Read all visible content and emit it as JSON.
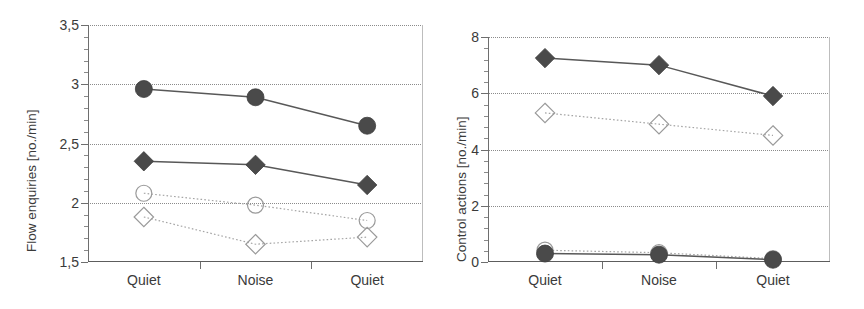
{
  "figure": {
    "panels": [
      "flow-enquiries",
      "control-actions"
    ]
  },
  "chart_data": [
    {
      "type": "line",
      "id": "flow-enquiries",
      "title": "",
      "xlabel": "",
      "ylabel": "Flow enquiries [no./min]",
      "categories": [
        "Quiet",
        "Noise",
        "Quiet"
      ],
      "ylim": [
        1.5,
        3.5
      ],
      "yticks": [
        1.5,
        2,
        2.5,
        3,
        3.5
      ],
      "ytick_labels": [
        "1,5",
        "2",
        "2,5",
        "3",
        "3,5"
      ],
      "minor_ticks_per_interval": 5,
      "grid": true,
      "grid_axis": "y",
      "grid_style": "dotted",
      "legend": "none",
      "series": [
        {
          "name": "filled-circle",
          "marker": "circle",
          "fill": "solid",
          "color": "#4a4a4a",
          "line_style": "solid",
          "values": [
            2.96,
            2.89,
            2.65
          ]
        },
        {
          "name": "filled-diamond",
          "marker": "diamond",
          "fill": "solid",
          "color": "#4a4a4a",
          "line_style": "solid",
          "values": [
            2.35,
            2.32,
            2.15
          ]
        },
        {
          "name": "open-circle",
          "marker": "circle",
          "fill": "open",
          "color": "#9a9a9a",
          "line_style": "dotted",
          "values": [
            2.08,
            1.98,
            1.85
          ]
        },
        {
          "name": "open-diamond",
          "marker": "diamond",
          "fill": "open",
          "color": "#9a9a9a",
          "line_style": "dotted",
          "values": [
            1.88,
            1.65,
            1.71
          ]
        }
      ]
    },
    {
      "type": "line",
      "id": "control-actions",
      "title": "",
      "xlabel": "",
      "ylabel": "Control actions [no./min]",
      "categories": [
        "Quiet",
        "Noise",
        "Quiet"
      ],
      "ylim": [
        0,
        8
      ],
      "yticks": [
        0,
        2,
        4,
        6,
        8
      ],
      "ytick_labels": [
        "0",
        "2",
        "4",
        "6",
        "8"
      ],
      "minor_ticks_per_interval": 5,
      "grid": true,
      "grid_axis": "y",
      "grid_style": "dotted",
      "legend": "none",
      "series": [
        {
          "name": "filled-diamond",
          "marker": "diamond",
          "fill": "solid",
          "color": "#4a4a4a",
          "line_style": "solid",
          "values": [
            7.25,
            7.0,
            5.9
          ]
        },
        {
          "name": "open-diamond",
          "marker": "diamond",
          "fill": "open",
          "color": "#9a9a9a",
          "line_style": "dotted",
          "values": [
            5.3,
            4.9,
            4.5
          ]
        },
        {
          "name": "open-circle",
          "marker": "circle",
          "fill": "open",
          "color": "#9a9a9a",
          "line_style": "dotted",
          "values": [
            0.42,
            0.33,
            0.12
          ]
        },
        {
          "name": "filled-circle",
          "marker": "circle",
          "fill": "solid",
          "color": "#4a4a4a",
          "line_style": "solid",
          "values": [
            0.3,
            0.26,
            0.08
          ]
        }
      ]
    }
  ],
  "colors": {
    "solid_marker": "#4a4a4a",
    "open_marker_stroke": "#9a9a9a",
    "axis": "#6e6e6e",
    "grid": "#8b8b8b",
    "text": "#3a3a3a",
    "background": "#ffffff"
  }
}
